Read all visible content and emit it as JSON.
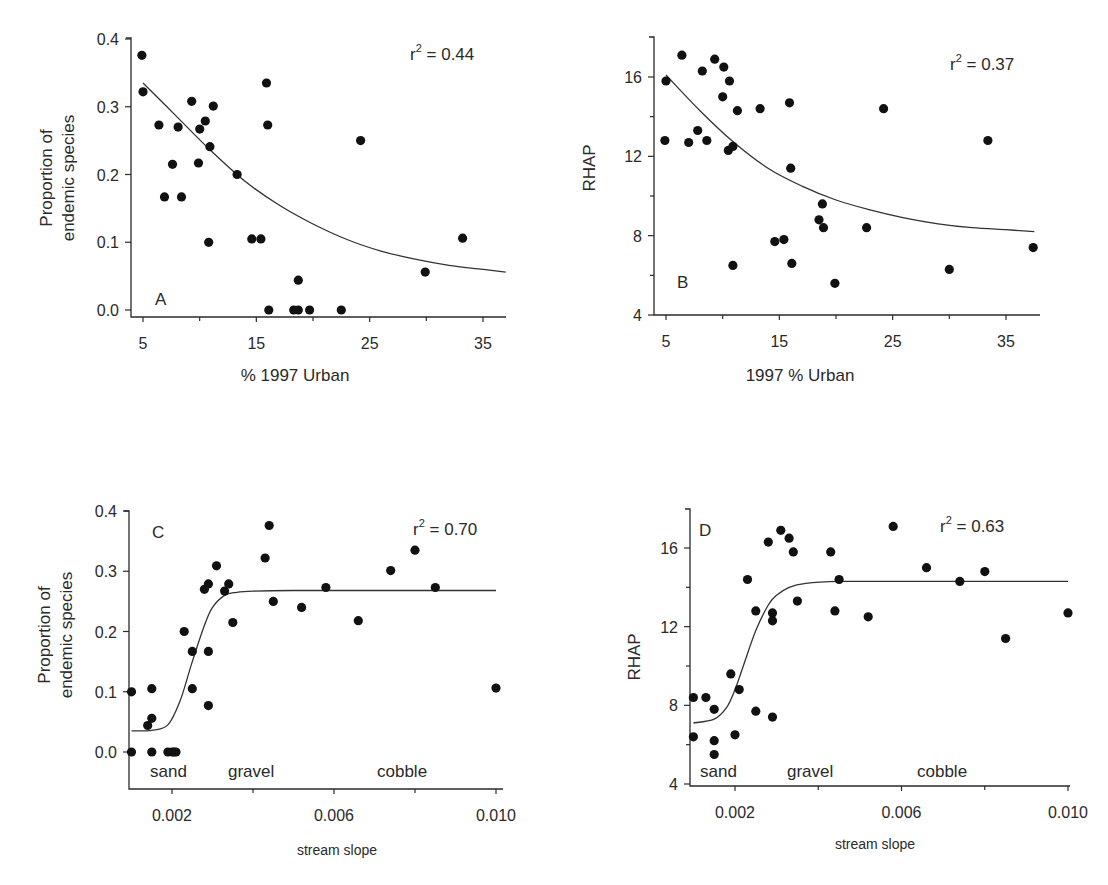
{
  "figure": {
    "panels": [
      {
        "id": "A",
        "panel_label": "A",
        "r2_label": "r",
        "r2_sup": "2",
        "r2_value": " = 0.44",
        "xlabel": "% 1997 Urban",
        "ylabel_line1": "Proportion of",
        "ylabel_line2": "endemic species",
        "xticks": [
          "5",
          "15",
          "25",
          "35"
        ],
        "yticks": [
          "0.0",
          "0.1",
          "0.2",
          "0.3",
          "0.4"
        ],
        "substrate_labels": []
      },
      {
        "id": "B",
        "panel_label": "B",
        "r2_label": "r",
        "r2_sup": "2",
        "r2_value": " = 0.37",
        "xlabel": "1997 % Urban",
        "ylabel_line1": "RHAP",
        "ylabel_line2": "",
        "xticks": [
          "5",
          "15",
          "25",
          "35"
        ],
        "yticks": [
          "4",
          "8",
          "12",
          "16"
        ],
        "substrate_labels": []
      },
      {
        "id": "C",
        "panel_label": "C",
        "r2_label": "r",
        "r2_sup": "2",
        "r2_value": " = 0.70",
        "xlabel": "stream slope",
        "ylabel_line1": "Proportion of",
        "ylabel_line2": "endemic species",
        "xticks": [
          "0.002",
          "0.006",
          "0.010"
        ],
        "yticks": [
          "0.0",
          "0.1",
          "0.2",
          "0.3",
          "0.4"
        ],
        "substrate_labels": [
          "sand",
          "gravel",
          "cobble"
        ]
      },
      {
        "id": "D",
        "panel_label": "D",
        "r2_label": "r",
        "r2_sup": "2",
        "r2_value": " = 0.63",
        "xlabel": "stream slope",
        "ylabel_line1": "RHAP",
        "ylabel_line2": "",
        "xticks": [
          "0.002",
          "0.006",
          "0.010"
        ],
        "yticks": [
          "4",
          "8",
          "12",
          "16"
        ],
        "substrate_labels": [
          "sand",
          "gravel",
          "cobble"
        ]
      }
    ]
  },
  "chart_data": [
    {
      "type": "scatter",
      "panel": "A",
      "title": "",
      "xlabel": "% 1997 Urban",
      "ylabel": "Proportion of endemic species",
      "xlim": [
        4,
        37
      ],
      "ylim": [
        0,
        0.4
      ],
      "xticks": [
        5,
        15,
        25,
        35
      ],
      "yticks": [
        0.0,
        0.1,
        0.2,
        0.3,
        0.4
      ],
      "grid": false,
      "annotations": [
        "r² = 0.44",
        "A"
      ],
      "fit": {
        "type": "exponential decay",
        "x": [
          5,
          8,
          11,
          14,
          17,
          20,
          23,
          26,
          29,
          32,
          35,
          37
        ],
        "y": [
          0.335,
          0.285,
          0.235,
          0.19,
          0.155,
          0.127,
          0.104,
          0.087,
          0.075,
          0.066,
          0.06,
          0.056
        ]
      },
      "points": [
        [
          4.9,
          0.376
        ],
        [
          5.0,
          0.322
        ],
        [
          6.4,
          0.273
        ],
        [
          6.9,
          0.167
        ],
        [
          7.6,
          0.215
        ],
        [
          8.1,
          0.27
        ],
        [
          8.4,
          0.167
        ],
        [
          9.3,
          0.308
        ],
        [
          9.9,
          0.217
        ],
        [
          10.0,
          0.267
        ],
        [
          10.5,
          0.279
        ],
        [
          10.8,
          0.1
        ],
        [
          10.9,
          0.241
        ],
        [
          11.2,
          0.301
        ],
        [
          13.3,
          0.2
        ],
        [
          14.6,
          0.105
        ],
        [
          15.4,
          0.105
        ],
        [
          15.9,
          0.335
        ],
        [
          16.0,
          0.273
        ],
        [
          16.1,
          0.0
        ],
        [
          18.3,
          0.0
        ],
        [
          18.7,
          0.0
        ],
        [
          18.7,
          0.044
        ],
        [
          19.7,
          0.0
        ],
        [
          22.5,
          0.0
        ],
        [
          24.2,
          0.25
        ],
        [
          29.9,
          0.056
        ],
        [
          33.2,
          0.106
        ]
      ]
    },
    {
      "type": "scatter",
      "panel": "B",
      "title": "",
      "xlabel": "1997 % Urban",
      "ylabel": "RHAP",
      "xlim": [
        4,
        38
      ],
      "ylim": [
        4,
        18
      ],
      "xticks": [
        5,
        15,
        25,
        35
      ],
      "yticks": [
        4,
        8,
        12,
        16
      ],
      "grid": false,
      "annotations": [
        "r² = 0.37",
        "B"
      ],
      "fit": {
        "type": "exponential decay",
        "x": [
          5,
          8,
          11,
          14,
          17,
          20,
          23,
          26,
          29,
          32,
          35,
          37.5
        ],
        "y": [
          16.1,
          14.3,
          12.7,
          11.4,
          10.5,
          9.8,
          9.3,
          8.9,
          8.6,
          8.4,
          8.3,
          8.2
        ]
      },
      "points": [
        [
          4.9,
          12.8
        ],
        [
          5.0,
          15.8
        ],
        [
          6.4,
          17.1
        ],
        [
          7.0,
          12.7
        ],
        [
          7.8,
          13.3
        ],
        [
          8.2,
          16.3
        ],
        [
          8.6,
          12.8
        ],
        [
          9.3,
          16.9
        ],
        [
          10.0,
          15.0
        ],
        [
          10.1,
          16.5
        ],
        [
          10.5,
          12.3
        ],
        [
          10.6,
          15.8
        ],
        [
          10.9,
          12.5
        ],
        [
          11.3,
          14.3
        ],
        [
          10.9,
          6.5
        ],
        [
          13.3,
          14.4
        ],
        [
          14.6,
          7.7
        ],
        [
          15.4,
          7.8
        ],
        [
          15.9,
          14.7
        ],
        [
          16.0,
          11.4
        ],
        [
          16.1,
          6.6
        ],
        [
          18.5,
          8.8
        ],
        [
          18.8,
          9.6
        ],
        [
          18.9,
          8.4
        ],
        [
          19.9,
          5.6
        ],
        [
          22.7,
          8.4
        ],
        [
          24.2,
          14.4
        ],
        [
          30.0,
          6.3
        ],
        [
          33.4,
          12.8
        ],
        [
          37.4,
          7.4
        ]
      ]
    },
    {
      "type": "scatter",
      "panel": "C",
      "title": "",
      "xlabel": "stream slope",
      "ylabel": "Proportion of endemic species",
      "xlim": [
        0.0009,
        0.0101
      ],
      "ylim": [
        -0.06,
        0.4
      ],
      "xticks": [
        0.002,
        0.006,
        0.01
      ],
      "yticks": [
        0.0,
        0.1,
        0.2,
        0.3,
        0.4
      ],
      "grid": false,
      "annotations": [
        "r² = 0.70",
        "C",
        "sand",
        "gravel",
        "cobble"
      ],
      "fit": {
        "type": "sigmoid",
        "x": [
          0.001,
          0.0015,
          0.0019,
          0.0022,
          0.0025,
          0.0028,
          0.003,
          0.0033,
          0.0036,
          0.004,
          0.005,
          0.007,
          0.01
        ],
        "y": [
          0.035,
          0.036,
          0.045,
          0.085,
          0.15,
          0.21,
          0.24,
          0.26,
          0.265,
          0.267,
          0.268,
          0.268,
          0.268
        ]
      },
      "points": [
        [
          0.001,
          0.1
        ],
        [
          0.001,
          0.0
        ],
        [
          0.0014,
          0.044
        ],
        [
          0.0015,
          0.105
        ],
        [
          0.0015,
          0.056
        ],
        [
          0.0015,
          0.0
        ],
        [
          0.0019,
          0.0
        ],
        [
          0.002,
          0.0
        ],
        [
          0.00205,
          0.0
        ],
        [
          0.0021,
          0.0
        ],
        [
          0.0023,
          0.2
        ],
        [
          0.0025,
          0.167
        ],
        [
          0.0025,
          0.105
        ],
        [
          0.0028,
          0.27
        ],
        [
          0.0029,
          0.279
        ],
        [
          0.0029,
          0.167
        ],
        [
          0.0029,
          0.077
        ],
        [
          0.0031,
          0.309
        ],
        [
          0.0033,
          0.267
        ],
        [
          0.0034,
          0.279
        ],
        [
          0.0035,
          0.215
        ],
        [
          0.0043,
          0.322
        ],
        [
          0.0044,
          0.376
        ],
        [
          0.0045,
          0.25
        ],
        [
          0.0052,
          0.24
        ],
        [
          0.0058,
          0.273
        ],
        [
          0.0066,
          0.218
        ],
        [
          0.0074,
          0.301
        ],
        [
          0.008,
          0.335
        ],
        [
          0.0085,
          0.273
        ],
        [
          0.01,
          0.106
        ]
      ]
    },
    {
      "type": "scatter",
      "panel": "D",
      "title": "",
      "xlabel": "stream slope",
      "ylabel": "RHAP",
      "xlim": [
        0.0009,
        0.0101
      ],
      "ylim": [
        4,
        18
      ],
      "xticks": [
        0.002,
        0.006,
        0.01
      ],
      "yticks": [
        4,
        8,
        12,
        16
      ],
      "grid": false,
      "annotations": [
        "r² = 0.63",
        "D",
        "sand",
        "gravel",
        "cobble"
      ],
      "fit": {
        "type": "sigmoid",
        "x": [
          0.001,
          0.0015,
          0.0018,
          0.002,
          0.0022,
          0.0025,
          0.0028,
          0.003,
          0.0033,
          0.0037,
          0.0045,
          0.006,
          0.01
        ],
        "y": [
          7.1,
          7.3,
          7.9,
          8.8,
          10.0,
          11.8,
          13.1,
          13.6,
          14.0,
          14.2,
          14.3,
          14.3,
          14.3
        ]
      },
      "points": [
        [
          0.001,
          8.4
        ],
        [
          0.001,
          6.4
        ],
        [
          0.0013,
          8.4
        ],
        [
          0.0015,
          7.8
        ],
        [
          0.0015,
          6.2
        ],
        [
          0.0015,
          5.5
        ],
        [
          0.0019,
          9.6
        ],
        [
          0.002,
          6.5
        ],
        [
          0.0021,
          8.8
        ],
        [
          0.0023,
          14.4
        ],
        [
          0.0025,
          12.8
        ],
        [
          0.0025,
          7.7
        ],
        [
          0.0028,
          16.3
        ],
        [
          0.0029,
          12.7
        ],
        [
          0.0029,
          12.3
        ],
        [
          0.0029,
          7.4
        ],
        [
          0.0031,
          16.9
        ],
        [
          0.0033,
          16.5
        ],
        [
          0.0034,
          15.8
        ],
        [
          0.0035,
          13.3
        ],
        [
          0.0043,
          15.8
        ],
        [
          0.0044,
          12.8
        ],
        [
          0.0045,
          14.4
        ],
        [
          0.0052,
          12.5
        ],
        [
          0.0058,
          17.1
        ],
        [
          0.0066,
          15.0
        ],
        [
          0.0074,
          14.3
        ],
        [
          0.008,
          14.8
        ],
        [
          0.0085,
          11.4
        ],
        [
          0.01,
          12.7
        ]
      ]
    }
  ],
  "layout": {
    "panels": {
      "A": {
        "x0": 131,
        "axis_y": 317,
        "top": 38,
        "right": 506,
        "xmap": [
          5,
          143,
          35,
          483
        ],
        "ymap": [
          0,
          310,
          0.4,
          39
        ],
        "ylabel_x": 52,
        "ylabel2_x": 74,
        "ylabel_cy": 178,
        "xlabel_y": 381,
        "xlabel_x": 295,
        "r2_x": 410,
        "r2_y": 60,
        "pl_x": 155,
        "pl_y": 305,
        "xtick_vals": [
          5,
          15,
          25,
          35
        ],
        "ytick_vals": [
          0,
          0.1,
          0.2,
          0.3,
          0.4
        ],
        "minor_x": [
          10,
          20,
          30
        ],
        "minor_y": []
      },
      "B": {
        "x0": 654,
        "axis_y": 315,
        "top": 37,
        "right": 1040,
        "xmap": [
          5,
          666,
          35,
          1006
        ],
        "ymap": [
          4,
          315,
          16,
          77
        ],
        "ylabel_x": 595,
        "ylabel2_x": 0,
        "ylabel_cy": 168,
        "xlabel_y": 381,
        "xlabel_x": 800,
        "r2_x": 950,
        "r2_y": 70,
        "pl_x": 677,
        "pl_y": 288,
        "xtick_vals": [
          5,
          15,
          25,
          35
        ],
        "ytick_vals": [
          4,
          8,
          12,
          16
        ],
        "minor_x": [
          10,
          20,
          30
        ],
        "minor_y": [
          6,
          10,
          14
        ]
      },
      "C": {
        "x0": 129,
        "axis_y": 789,
        "top": 511,
        "right": 503,
        "xmap": [
          0.002,
          172,
          0.01,
          496
        ],
        "ymap": [
          0,
          752,
          0.4,
          511
        ],
        "ylabel_x": 50,
        "ylabel2_x": 72,
        "ylabel_cy": 635,
        "xlabel_y": 855,
        "xlabel_x": 337,
        "r2_x": 413,
        "r2_y": 535,
        "pl_x": 152,
        "pl_y": 538,
        "xtick_vals": [
          0.002,
          0.006,
          0.01
        ],
        "ytick_vals": [
          0,
          0.1,
          0.2,
          0.3,
          0.4
        ],
        "minor_x": [
          0.004,
          0.008
        ],
        "minor_y": [],
        "sub_y": 777,
        "sub_x": [
          150,
          228,
          377
        ]
      },
      "D": {
        "x0": 690,
        "axis_y": 786,
        "top": 509,
        "right": 1070,
        "xmap": [
          0.002,
          735,
          0.01,
          1068
        ],
        "ymap": [
          4,
          784,
          16,
          548
        ],
        "ylabel_x": 640,
        "ylabel2_x": 0,
        "ylabel_cy": 657,
        "xlabel_y": 849,
        "xlabel_x": 875,
        "r2_x": 940,
        "r2_y": 532,
        "pl_x": 699,
        "pl_y": 536,
        "xtick_vals": [
          0.002,
          0.006,
          0.01
        ],
        "ytick_vals": [
          4,
          8,
          12,
          16
        ],
        "minor_x": [
          0.004,
          0.008
        ],
        "minor_y": [
          6,
          10,
          14
        ],
        "sub_y": 777,
        "sub_x": [
          700,
          787,
          917
        ]
      }
    }
  }
}
